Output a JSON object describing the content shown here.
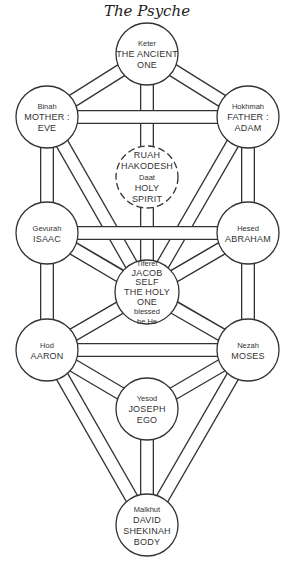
{
  "title": "The Psyche",
  "diagram": {
    "type": "tree-of-life",
    "nodes": [
      {
        "id": "keter",
        "cx": 147,
        "cy": 54,
        "r": 31,
        "dashed": false,
        "name": "Keter",
        "lines": [
          "THE ANCIENT",
          "ONE"
        ]
      },
      {
        "id": "binah",
        "cx": 47,
        "cy": 117,
        "r": 31,
        "dashed": false,
        "name": "Binah",
        "lines": [
          "MOTHER :",
          "EVE"
        ]
      },
      {
        "id": "hokhmah",
        "cx": 248,
        "cy": 117,
        "r": 31,
        "dashed": false,
        "name": "Hokhmah",
        "lines": [
          "FATHER :",
          "ADAM"
        ]
      },
      {
        "id": "daat",
        "cx": 147,
        "cy": 177,
        "r": 31,
        "dashed": true,
        "name": "Daat",
        "lines_before": [
          "RUAH",
          "HAKODESH"
        ],
        "lines": [
          "HOLY",
          "SPIRIT"
        ]
      },
      {
        "id": "gevurah",
        "cx": 47,
        "cy": 233,
        "r": 31,
        "dashed": false,
        "name": "Gevurah",
        "lines": [
          "ISAAC"
        ]
      },
      {
        "id": "hesed",
        "cx": 248,
        "cy": 233,
        "r": 31,
        "dashed": false,
        "name": "Hesed",
        "lines": [
          "ABRAHAM"
        ]
      },
      {
        "id": "tiferet",
        "cx": 147,
        "cy": 292,
        "r": 32,
        "dashed": false,
        "name": "Tiferet",
        "lines": [
          "JACOB",
          "SELF",
          "THE HOLY",
          "ONE"
        ],
        "lines_after": [
          "blessed",
          "be He"
        ]
      },
      {
        "id": "hod",
        "cx": 47,
        "cy": 350,
        "r": 31,
        "dashed": false,
        "name": "Hod",
        "lines": [
          "AARON"
        ]
      },
      {
        "id": "nezah",
        "cx": 248,
        "cy": 350,
        "r": 31,
        "dashed": false,
        "name": "Nezah",
        "lines": [
          "MOSES"
        ]
      },
      {
        "id": "yesod",
        "cx": 147,
        "cy": 409,
        "r": 31,
        "dashed": false,
        "name": "Yesod",
        "lines": [
          "JOSEPH",
          "EGO"
        ]
      },
      {
        "id": "malkhut",
        "cx": 147,
        "cy": 525,
        "r": 31,
        "dashed": false,
        "name": "Malkhut",
        "lines": [
          "DAVID",
          "SHEKINAH",
          "BODY"
        ]
      }
    ],
    "paths": [
      [
        "keter",
        "tiferet"
      ],
      [
        "binah",
        "tiferet"
      ],
      [
        "hokhmah",
        "tiferet"
      ],
      [
        "gevurah",
        "nezah"
      ],
      [
        "hesed",
        "hod"
      ],
      [
        "hod",
        "malkhut"
      ],
      [
        "nezah",
        "malkhut"
      ],
      [
        "yesod",
        "malkhut"
      ],
      [
        "binah",
        "gevurah"
      ],
      [
        "gevurah",
        "hod"
      ],
      [
        "hokhmah",
        "hesed"
      ],
      [
        "hesed",
        "nezah"
      ],
      [
        "keter",
        "binah"
      ],
      [
        "keter",
        "hokhmah"
      ],
      [
        "gevurah",
        "tiferet"
      ],
      [
        "hesed",
        "tiferet"
      ],
      [
        "tiferet",
        "hod"
      ],
      [
        "tiferet",
        "nezah"
      ],
      [
        "hod",
        "yesod"
      ],
      [
        "nezah",
        "yesod"
      ],
      [
        "binah",
        "hokhmah"
      ],
      [
        "gevurah",
        "hesed"
      ],
      [
        "hod",
        "nezah"
      ]
    ]
  }
}
